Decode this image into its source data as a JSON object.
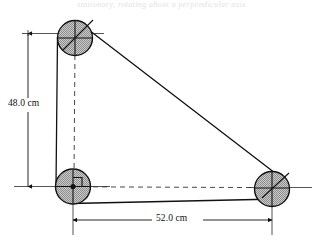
{
  "figure": {
    "title_strip": "stationary, rotating about a perpendicular axis",
    "background_color": "#ffffff",
    "line_color": "#1a1a1a",
    "disk_fill_color": "#b3b3b3",
    "disk_edge_color": "#1a1a1a",
    "dimensions": [
      {
        "id": "vertical",
        "label": "48.0 cm",
        "value": 48.0,
        "unit": "cm",
        "orientation": "vertical"
      },
      {
        "id": "horizontal",
        "label": "52.0 cm",
        "value": 52.0,
        "unit": "cm",
        "orientation": "horizontal"
      }
    ],
    "disks": [
      {
        "id": "top-left",
        "cx": 75,
        "cy": 38,
        "r": 17.5
      },
      {
        "id": "bottom-left",
        "cx": 73,
        "cy": 186.5,
        "r": 17.5
      },
      {
        "id": "bottom-right",
        "cx": 272,
        "cy": 189,
        "r": 17.5
      }
    ],
    "markers": {
      "right_angle": "right-angle-marker",
      "origin_dot": "origin-dot"
    }
  }
}
